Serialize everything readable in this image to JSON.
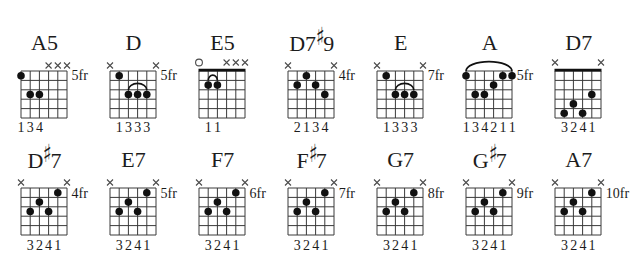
{
  "colors": {
    "ink": "#1c1c1c",
    "grid": "#3a3a3a",
    "dot": "#111111",
    "background": "#ffffff"
  },
  "rows": [
    {
      "chords": [
        {
          "title": [
            {
              "text": "A5"
            }
          ],
          "fret_label": "5fr",
          "nut": false,
          "markers": [
            {
              "string": 3,
              "type": "x"
            },
            {
              "string": 2,
              "type": "x"
            },
            {
              "string": 1,
              "type": "x"
            }
          ],
          "dots": [
            {
              "string": 6,
              "fret": 1,
              "finger": "1"
            },
            {
              "string": 5,
              "fret": 3,
              "finger": "3"
            },
            {
              "string": 4,
              "fret": 3,
              "finger": "4"
            }
          ],
          "arcs": []
        },
        {
          "title": [
            {
              "text": "D"
            }
          ],
          "fret_label": "5fr",
          "nut": false,
          "markers": [
            {
              "string": 6,
              "type": "x"
            },
            {
              "string": 1,
              "type": "x"
            }
          ],
          "dots": [
            {
              "string": 5,
              "fret": 1,
              "finger": "1"
            },
            {
              "string": 4,
              "fret": 3,
              "finger": "3"
            },
            {
              "string": 3,
              "fret": 3,
              "finger": "3"
            },
            {
              "string": 2,
              "fret": 3,
              "finger": "3"
            }
          ],
          "arcs": [
            {
              "from": 4,
              "to": 2,
              "fret": 3
            }
          ]
        },
        {
          "title": [
            {
              "text": "E5"
            }
          ],
          "fret_label": "",
          "nut": true,
          "markers": [
            {
              "string": 6,
              "type": "o"
            },
            {
              "string": 3,
              "type": "x"
            },
            {
              "string": 2,
              "type": "x"
            },
            {
              "string": 1,
              "type": "x"
            }
          ],
          "dots": [
            {
              "string": 5,
              "fret": 2,
              "finger": "1"
            },
            {
              "string": 4,
              "fret": 2,
              "finger": "1"
            }
          ],
          "arcs": [
            {
              "from": 5,
              "to": 4,
              "fret": 2
            }
          ]
        },
        {
          "title": [
            {
              "text": "D7"
            },
            {
              "text": "♯",
              "accidental": true
            },
            {
              "text": "9"
            }
          ],
          "fret_label": "4fr",
          "nut": false,
          "markers": [
            {
              "string": 6,
              "type": "x"
            },
            {
              "string": 1,
              "type": "x"
            }
          ],
          "dots": [
            {
              "string": 5,
              "fret": 2,
              "finger": "2"
            },
            {
              "string": 4,
              "fret": 1,
              "finger": "1"
            },
            {
              "string": 3,
              "fret": 2,
              "finger": "3"
            },
            {
              "string": 2,
              "fret": 3,
              "finger": "4"
            }
          ],
          "arcs": []
        },
        {
          "title": [
            {
              "text": "E"
            }
          ],
          "fret_label": "7fr",
          "nut": false,
          "markers": [
            {
              "string": 6,
              "type": "x"
            },
            {
              "string": 1,
              "type": "x"
            }
          ],
          "dots": [
            {
              "string": 5,
              "fret": 1,
              "finger": "1"
            },
            {
              "string": 4,
              "fret": 3,
              "finger": "3"
            },
            {
              "string": 3,
              "fret": 3,
              "finger": "3"
            },
            {
              "string": 2,
              "fret": 3,
              "finger": "3"
            }
          ],
          "arcs": [
            {
              "from": 4,
              "to": 2,
              "fret": 3
            }
          ]
        },
        {
          "title": [
            {
              "text": "A"
            }
          ],
          "fret_label": "5fr",
          "nut": false,
          "markers": [],
          "dots": [
            {
              "string": 6,
              "fret": 1,
              "finger": "1"
            },
            {
              "string": 5,
              "fret": 3,
              "finger": "3"
            },
            {
              "string": 4,
              "fret": 3,
              "finger": "4"
            },
            {
              "string": 3,
              "fret": 2,
              "finger": "2"
            },
            {
              "string": 2,
              "fret": 1,
              "finger": "1"
            },
            {
              "string": 1,
              "fret": 1,
              "finger": "1"
            }
          ],
          "arcs": [
            {
              "from": 6,
              "to": 1,
              "fret": 1
            }
          ]
        },
        {
          "title": [
            {
              "text": "D7"
            }
          ],
          "fret_label": "",
          "nut": true,
          "markers": [
            {
              "string": 6,
              "type": "x"
            },
            {
              "string": 1,
              "type": "x"
            }
          ],
          "dots": [
            {
              "string": 5,
              "fret": 5,
              "finger": "3"
            },
            {
              "string": 4,
              "fret": 4,
              "finger": "2"
            },
            {
              "string": 3,
              "fret": 5,
              "finger": "4"
            },
            {
              "string": 2,
              "fret": 3,
              "finger": "1"
            }
          ],
          "arcs": []
        }
      ]
    },
    {
      "chords": [
        {
          "title": [
            {
              "text": "D"
            },
            {
              "text": "♯",
              "accidental": true
            },
            {
              "text": "7"
            }
          ],
          "fret_label": "4fr",
          "nut": false,
          "markers": [
            {
              "string": 6,
              "type": "x"
            },
            {
              "string": 1,
              "type": "x"
            }
          ],
          "dots": [
            {
              "string": 5,
              "fret": 3,
              "finger": "3"
            },
            {
              "string": 4,
              "fret": 2,
              "finger": "2"
            },
            {
              "string": 3,
              "fret": 3,
              "finger": "4"
            },
            {
              "string": 2,
              "fret": 1,
              "finger": "1"
            }
          ],
          "arcs": []
        },
        {
          "title": [
            {
              "text": "E7"
            }
          ],
          "fret_label": "5fr",
          "nut": false,
          "markers": [
            {
              "string": 6,
              "type": "x"
            },
            {
              "string": 1,
              "type": "x"
            }
          ],
          "dots": [
            {
              "string": 5,
              "fret": 3,
              "finger": "3"
            },
            {
              "string": 4,
              "fret": 2,
              "finger": "2"
            },
            {
              "string": 3,
              "fret": 3,
              "finger": "4"
            },
            {
              "string": 2,
              "fret": 1,
              "finger": "1"
            }
          ],
          "arcs": []
        },
        {
          "title": [
            {
              "text": "F7"
            }
          ],
          "fret_label": "6fr",
          "nut": false,
          "markers": [
            {
              "string": 6,
              "type": "x"
            },
            {
              "string": 1,
              "type": "x"
            }
          ],
          "dots": [
            {
              "string": 5,
              "fret": 3,
              "finger": "3"
            },
            {
              "string": 4,
              "fret": 2,
              "finger": "2"
            },
            {
              "string": 3,
              "fret": 3,
              "finger": "4"
            },
            {
              "string": 2,
              "fret": 1,
              "finger": "1"
            }
          ],
          "arcs": []
        },
        {
          "title": [
            {
              "text": "F"
            },
            {
              "text": "♯",
              "accidental": true
            },
            {
              "text": "7"
            }
          ],
          "fret_label": "7fr",
          "nut": false,
          "markers": [
            {
              "string": 6,
              "type": "x"
            },
            {
              "string": 1,
              "type": "x"
            }
          ],
          "dots": [
            {
              "string": 5,
              "fret": 3,
              "finger": "3"
            },
            {
              "string": 4,
              "fret": 2,
              "finger": "2"
            },
            {
              "string": 3,
              "fret": 3,
              "finger": "4"
            },
            {
              "string": 2,
              "fret": 1,
              "finger": "1"
            }
          ],
          "arcs": []
        },
        {
          "title": [
            {
              "text": "G7"
            }
          ],
          "fret_label": "8fr",
          "nut": false,
          "markers": [
            {
              "string": 6,
              "type": "x"
            },
            {
              "string": 1,
              "type": "x"
            }
          ],
          "dots": [
            {
              "string": 5,
              "fret": 3,
              "finger": "3"
            },
            {
              "string": 4,
              "fret": 2,
              "finger": "2"
            },
            {
              "string": 3,
              "fret": 3,
              "finger": "4"
            },
            {
              "string": 2,
              "fret": 1,
              "finger": "1"
            }
          ],
          "arcs": []
        },
        {
          "title": [
            {
              "text": "G"
            },
            {
              "text": "♯",
              "accidental": true
            },
            {
              "text": "7"
            }
          ],
          "fret_label": "9fr",
          "nut": false,
          "markers": [
            {
              "string": 6,
              "type": "x"
            },
            {
              "string": 1,
              "type": "x"
            }
          ],
          "dots": [
            {
              "string": 5,
              "fret": 3,
              "finger": "3"
            },
            {
              "string": 4,
              "fret": 2,
              "finger": "2"
            },
            {
              "string": 3,
              "fret": 3,
              "finger": "4"
            },
            {
              "string": 2,
              "fret": 1,
              "finger": "1"
            }
          ],
          "arcs": []
        },
        {
          "title": [
            {
              "text": "A7"
            }
          ],
          "fret_label": "10fr",
          "nut": false,
          "markers": [
            {
              "string": 6,
              "type": "x"
            },
            {
              "string": 1,
              "type": "x"
            }
          ],
          "dots": [
            {
              "string": 5,
              "fret": 3,
              "finger": "3"
            },
            {
              "string": 4,
              "fret": 2,
              "finger": "2"
            },
            {
              "string": 3,
              "fret": 3,
              "finger": "4"
            },
            {
              "string": 2,
              "fret": 1,
              "finger": "1"
            }
          ],
          "arcs": []
        }
      ]
    }
  ]
}
